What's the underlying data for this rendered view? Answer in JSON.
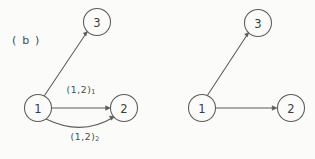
{
  "figure": {
    "panel_label": "( b )",
    "background_color": "#fbfbfa",
    "ink_color": "#5b5b5b",
    "text_color": "#4a4a4a"
  },
  "graphs": [
    {
      "id": "left-graph",
      "name": "multigraph-with-parallel-edges",
      "nodes": [
        {
          "id": "L1",
          "label": "1",
          "cx": 38,
          "cy": 108,
          "r": 13.5
        },
        {
          "id": "L2",
          "label": "2",
          "cx": 124,
          "cy": 108,
          "r": 13.5
        },
        {
          "id": "L3",
          "label": "3",
          "cx": 97,
          "cy": 22,
          "r": 13.5
        }
      ],
      "edges": [
        {
          "id": "L1-L3",
          "from": "1",
          "to": "3",
          "shape": "straight",
          "directed": true,
          "label": ""
        },
        {
          "id": "L1-L2-a",
          "from": "1",
          "to": "2",
          "shape": "straight",
          "directed": true,
          "label": "(1,2)",
          "label_sub": "1"
        },
        {
          "id": "L1-L2-b",
          "from": "1",
          "to": "2",
          "shape": "curved",
          "directed": true,
          "label": "(1,2)",
          "label_sub": "2"
        }
      ],
      "edge_labels": [
        {
          "id": "label-upper",
          "text": "(1,2)",
          "sub": "1",
          "x": 81,
          "y": 89
        },
        {
          "id": "label-lower",
          "text": "(1,2)",
          "sub": "2",
          "x": 85,
          "y": 136
        }
      ]
    },
    {
      "id": "right-graph",
      "name": "simple-graph-no-labels",
      "nodes": [
        {
          "id": "R1",
          "label": "1",
          "cx": 202,
          "cy": 108,
          "r": 13.5
        },
        {
          "id": "R2",
          "label": "2",
          "cx": 291,
          "cy": 108,
          "r": 13.5
        },
        {
          "id": "R3",
          "label": "3",
          "cx": 258,
          "cy": 23,
          "r": 13.5
        }
      ],
      "edges": [
        {
          "id": "R1-R3",
          "from": "1",
          "to": "3",
          "shape": "straight",
          "directed": true,
          "label": ""
        },
        {
          "id": "R1-R2",
          "from": "1",
          "to": "2",
          "shape": "straight",
          "directed": true,
          "label": ""
        }
      ],
      "edge_labels": []
    }
  ]
}
